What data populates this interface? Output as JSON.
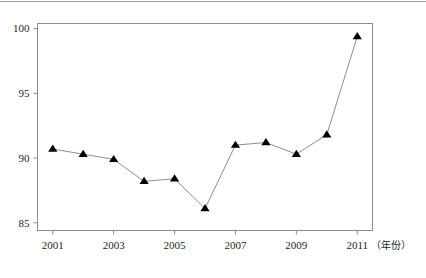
{
  "top_cutoff": {
    "ghost_text": "                     "
  },
  "chart_data": {
    "type": "line",
    "title": "",
    "subtitle": "",
    "xlabel": "（年份）",
    "ylabel": "",
    "x": [
      2001,
      2002,
      2003,
      2004,
      2005,
      2006,
      2007,
      2008,
      2009,
      2010,
      2011
    ],
    "values": [
      90.7,
      90.3,
      89.9,
      88.2,
      88.4,
      86.1,
      91.0,
      91.2,
      90.3,
      91.8,
      99.4
    ],
    "series": [
      {
        "name": "",
        "values": [
          90.7,
          90.3,
          89.9,
          88.2,
          88.4,
          86.1,
          91.0,
          91.2,
          90.3,
          91.8,
          99.4
        ]
      }
    ],
    "xlim": [
      2000.5,
      2011.5
    ],
    "ylim": [
      84.4,
      100.4
    ],
    "x_tick_labels": [
      "2001",
      "2003",
      "2005",
      "2007",
      "2009",
      "2011"
    ],
    "x_tick_values": [
      2001,
      2003,
      2005,
      2007,
      2009,
      2011
    ],
    "y_tick_labels": [
      "85",
      "90",
      "95",
      "100"
    ],
    "y_tick_values": [
      85,
      90,
      95,
      100
    ],
    "grid": false,
    "legend": false,
    "legend_position": "none",
    "marker": "triangle-up",
    "marker_color": "#000000",
    "line_color": "#808080",
    "frame_color": "#8c8c8c",
    "background_color": "#ffffff"
  },
  "axis_unit": {
    "x_unit_text": "（年份）"
  }
}
